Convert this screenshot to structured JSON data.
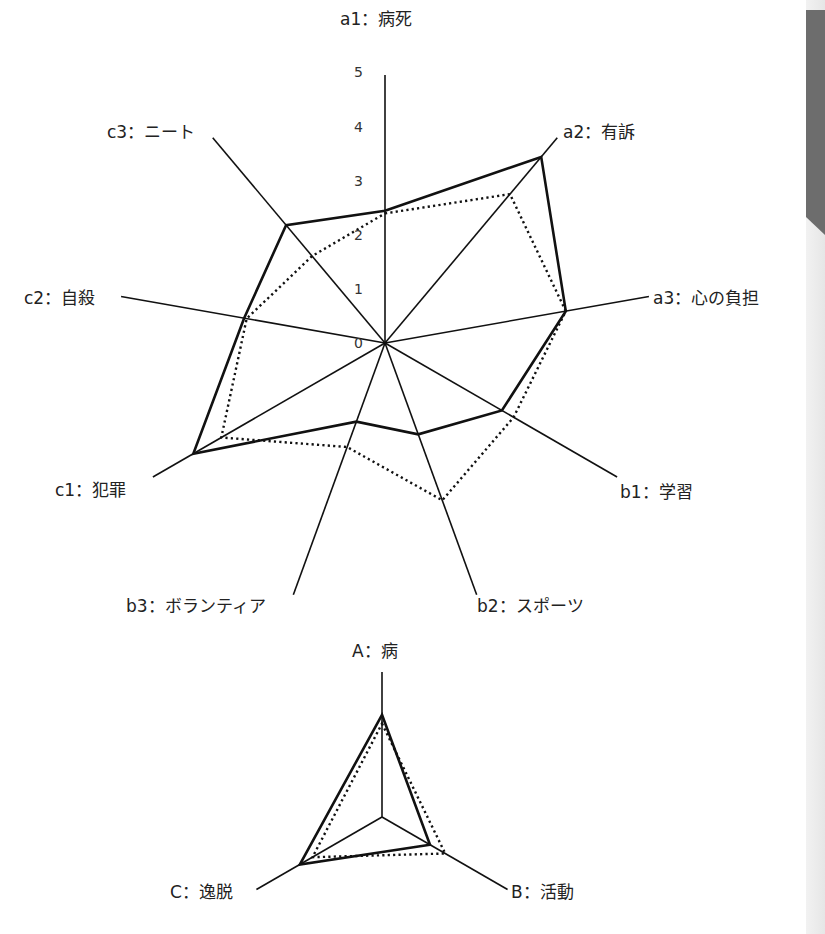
{
  "chart_data": [
    {
      "type": "radar",
      "title": "",
      "axes": [
        "a1：病死",
        "a2：有訴",
        "a3：心の負担",
        "b1：学習",
        "b2：スポーツ",
        "b3：ボランティア",
        "c1：犯罪",
        "c2：自殺",
        "c3：ニート"
      ],
      "range": [
        0,
        5
      ],
      "tick_labels": [
        "0",
        "1",
        "2",
        "3",
        "4",
        "5"
      ],
      "series": [
        {
          "name": "solid",
          "style": "solid",
          "values": [
            2.45,
            4.5,
            3.4,
            2.5,
            1.8,
            1.55,
            4.1,
            2.65,
            2.85
          ]
        },
        {
          "name": "dotted",
          "style": "dotted",
          "values": [
            2.4,
            3.6,
            3.4,
            2.75,
            3.1,
            2.05,
            3.5,
            2.6,
            2.1
          ]
        }
      ]
    },
    {
      "type": "radar",
      "title": "",
      "axes": [
        "A：病",
        "B：活動",
        "C：逸脱"
      ],
      "range": [
        0,
        5
      ],
      "tick_labels": [],
      "series": [
        {
          "name": "solid",
          "style": "solid",
          "values": [
            3.5,
            1.9,
            3.25
          ]
        },
        {
          "name": "dotted",
          "style": "dotted",
          "values": [
            3.2,
            2.5,
            2.75
          ]
        }
      ]
    }
  ],
  "main": {
    "labels": {
      "a1": "a1：病死",
      "a2": "a2：有訴",
      "a3": "a3：心の負担",
      "b1": "b1：学習",
      "b2": "b2：スポーツ",
      "b3": "b3：ボランティア",
      "c1": "c1：犯罪",
      "c2": "c2：自殺",
      "c3": "c3：ニート"
    },
    "ticks": [
      "0",
      "1",
      "2",
      "3",
      "4",
      "5"
    ]
  },
  "summary": {
    "labels": {
      "A": "A：病",
      "B": "B：活動",
      "C": "C：逸脱"
    }
  },
  "colors": {
    "line": "#111111",
    "page_edge": "#e9e9e9",
    "page_tab": "#6d6d6d"
  }
}
